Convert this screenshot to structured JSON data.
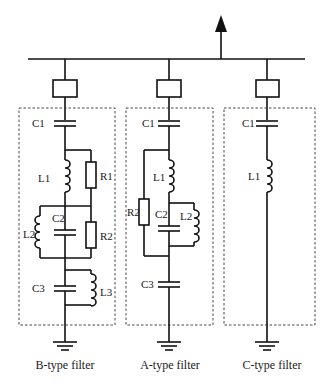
{
  "diagram": {
    "filters": [
      {
        "name": "B-type filter",
        "components": [
          "C1",
          "L1",
          "R1",
          "C2",
          "L2",
          "R2",
          "C3",
          "L3"
        ],
        "labels": {
          "c1": "C1",
          "l1": "L1",
          "r1": "R1",
          "c2": "C2",
          "l2": "L2",
          "r2": "R2",
          "c3": "C3",
          "l3": "L3"
        }
      },
      {
        "name": "A-type filter",
        "components": [
          "C1",
          "L1",
          "R2",
          "C2",
          "L2",
          "C3"
        ],
        "labels": {
          "c1": "C1",
          "l1": "L1",
          "r2": "R2",
          "c2": "C2",
          "l2": "L2",
          "c3": "C3"
        }
      },
      {
        "name": "C-type filter",
        "components": [
          "C1",
          "L1"
        ],
        "labels": {
          "c1": "C1",
          "l1": "L1"
        }
      }
    ],
    "colors": {
      "line": "#111111",
      "background": "#ffffff"
    }
  }
}
